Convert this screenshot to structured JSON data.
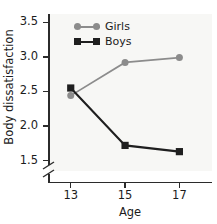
{
  "chart_data": {
    "type": "line",
    "title": "",
    "xlabel": "Age",
    "ylabel": "Body dissatisfaction",
    "x": [
      13,
      15,
      17
    ],
    "categories": [
      "13",
      "15",
      "17"
    ],
    "series": [
      {
        "name": "Girls",
        "values": [
          2.44,
          2.92,
          2.99
        ],
        "color": "#8c8c8c",
        "marker": "circle"
      },
      {
        "name": "Boys",
        "values": [
          2.55,
          1.72,
          1.63
        ],
        "color": "#1f1f1f",
        "marker": "square"
      }
    ],
    "xlim": [
      12.2,
      18.2
    ],
    "ylim": [
      1.35,
      3.62
    ],
    "yticks": [
      "3.5",
      "3.0",
      "2.5",
      "2.0",
      "1.5"
    ],
    "ytick_values": [
      3.5,
      3.0,
      2.5,
      2.0,
      1.5
    ],
    "xticks": [
      "13",
      "15",
      "17"
    ],
    "grid": false,
    "axis_break": "y-axis break below 1.5",
    "legend_position": "top-left inside plot"
  },
  "legend": {
    "entries": [
      {
        "label": "Girls"
      },
      {
        "label": "Boys"
      }
    ]
  },
  "colors": {
    "girls": "#8c8c8c",
    "boys": "#1f1f1f",
    "axis": "#2b2b2b",
    "panel_background": "#f7f7f5",
    "page_background": "#ffffff",
    "text": "#1c1c1c"
  }
}
